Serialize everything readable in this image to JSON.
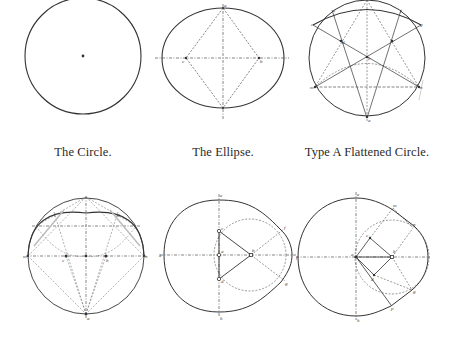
{
  "captions": {
    "circle": "The Circle.",
    "ellipse": "The Ellipse.",
    "flattened_a": "Type A Flattened Circle."
  },
  "diagrams": [
    {
      "id": "circle",
      "title": "The Circle.",
      "labels": []
    },
    {
      "id": "ellipse",
      "title": "The Ellipse.",
      "labels": [
        "a",
        "c",
        "b"
      ]
    },
    {
      "id": "flattened-circle-type-a",
      "title": "Type A Flattened Circle.",
      "labels": [
        "c",
        "d",
        "m",
        "n",
        "e",
        "f",
        "g",
        "a",
        "b"
      ]
    },
    {
      "id": "flattened-circle-type-b",
      "title": "",
      "labels": [
        "m",
        "c",
        "b",
        "f",
        "g",
        "n",
        "a"
      ]
    },
    {
      "id": "egg-type-1",
      "title": "",
      "labels": [
        "a",
        "b",
        "c",
        "d",
        "e",
        "f",
        "g",
        "h",
        "k"
      ]
    },
    {
      "id": "egg-type-2",
      "title": "",
      "labels": [
        "a",
        "b",
        "c",
        "d",
        "e",
        "f",
        "g",
        "h",
        "m",
        "n"
      ]
    }
  ],
  "colors": {
    "line": "#333333",
    "construction": "#555555",
    "background": "#ffffff"
  }
}
